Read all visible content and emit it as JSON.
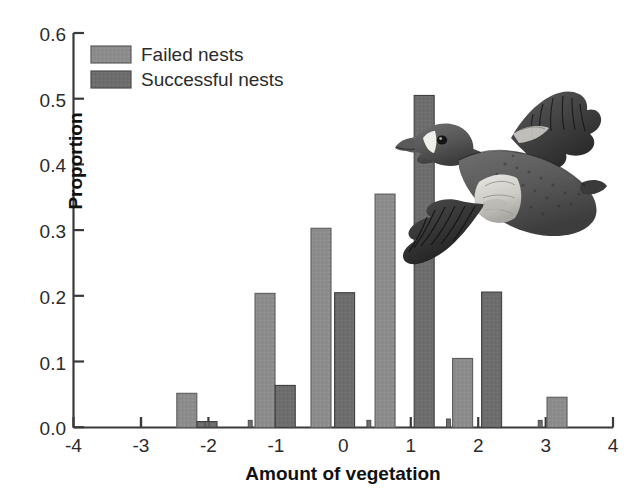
{
  "chart_data": {
    "type": "bar",
    "title": "",
    "xlabel": "Amount of vegetation",
    "ylabel": "Proportion",
    "xlim": [
      -4,
      4
    ],
    "ylim": [
      0.0,
      0.6
    ],
    "xticks": [
      -4,
      -3,
      -2,
      -1,
      0,
      1,
      2,
      3,
      4
    ],
    "xtick_labels": [
      "-4",
      "-3",
      "-2",
      "-1",
      "0",
      "1",
      "2",
      "3",
      "4"
    ],
    "yticks": [
      0.0,
      0.1,
      0.2,
      0.3,
      0.4,
      0.5,
      0.6
    ],
    "ytick_labels": [
      "0.0",
      "0.1",
      "0.2",
      "0.3",
      "0.4",
      "0.5",
      "0.6"
    ],
    "grid": false,
    "legend_position": "top-left",
    "series": [
      {
        "name": "Failed nests",
        "color": "#8c8c8c",
        "x": [
          -2.32,
          -1.16,
          -0.33,
          0.62,
          1.77,
          3.17
        ],
        "values": [
          0.052,
          0.204,
          0.303,
          0.355,
          0.105,
          0.046
        ]
      },
      {
        "name": "Successful nests",
        "color": "#6d6d6d",
        "x": [
          -2.02,
          -0.86,
          0.02,
          1.2,
          2.2
        ],
        "values": [
          0.009,
          0.064,
          0.205,
          0.505,
          0.206
        ]
      }
    ],
    "bars": [
      {
        "series": "Failed nests",
        "x": -2.32,
        "value": 0.052
      },
      {
        "series": "Successful nests",
        "x": -2.02,
        "value": 0.009
      },
      {
        "series": "Failed nests",
        "x": -1.16,
        "value": 0.204
      },
      {
        "series": "Successful nests",
        "x": -0.86,
        "value": 0.064
      },
      {
        "series": "Failed nests",
        "x": -0.33,
        "value": 0.303
      },
      {
        "series": "Successful nests",
        "x": 0.02,
        "value": 0.205
      },
      {
        "series": "Failed nests",
        "x": 0.62,
        "value": 0.355
      },
      {
        "series": "Successful nests",
        "x": 1.2,
        "value": 0.505
      },
      {
        "series": "Failed nests",
        "x": 1.77,
        "value": 0.105
      },
      {
        "series": "Successful nests",
        "x": 2.2,
        "value": 0.206
      },
      {
        "series": "Failed nests",
        "x": 3.17,
        "value": 0.046
      }
    ],
    "tiny_markers": [
      {
        "series": "Successful nests",
        "x": -2.02,
        "value": 0.009
      },
      {
        "series": "Successful nests",
        "x": -1.38,
        "value": 0.011
      },
      {
        "series": "Successful nests",
        "x": 0.38,
        "value": 0.011
      },
      {
        "series": "Successful nests",
        "x": 1.56,
        "value": 0.013
      },
      {
        "series": "Successful nests",
        "x": 2.92,
        "value": 0.011
      }
    ]
  },
  "legend": {
    "items": [
      {
        "label": "Failed nests",
        "color": "#8c8c8c"
      },
      {
        "label": "Successful nests",
        "color": "#6d6d6d"
      }
    ]
  },
  "illustration": {
    "name": "flying-duck-illustration",
    "alt": "Flying duck"
  },
  "colors": {
    "axis": "#3a3a3a",
    "failed": "#8c8c8c",
    "successful": "#6d6d6d",
    "background": "#ffffff",
    "text": "#2b2b2b"
  }
}
